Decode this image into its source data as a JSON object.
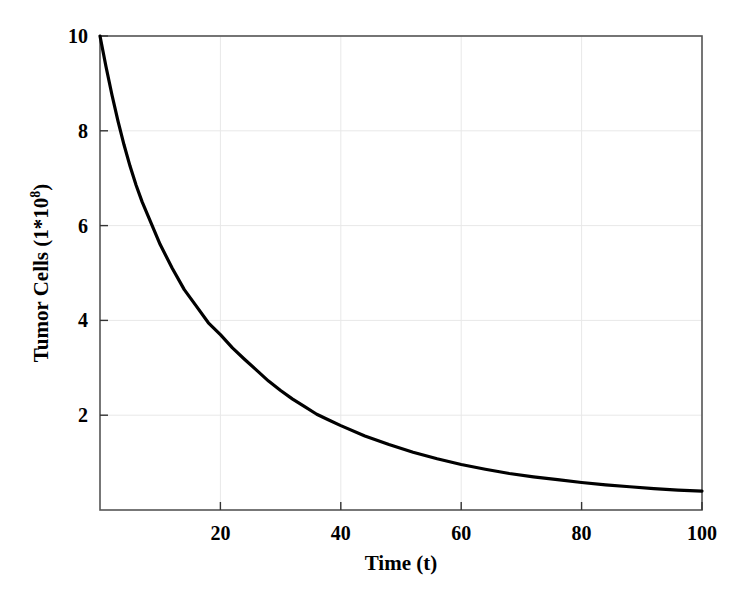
{
  "chart_data": {
    "type": "line",
    "title": "",
    "xlabel": "Time (t)",
    "ylabel_main": "Tumor Cells (1*10",
    "ylabel_exponent": "8",
    "ylabel_close": ")",
    "ylabel_full": "Tumor Cells (1*10^8)",
    "xlim": [
      0,
      100
    ],
    "ylim": [
      0,
      10
    ],
    "xticks": [
      20,
      40,
      60,
      80,
      100
    ],
    "xtick_labels": [
      "20",
      "40",
      "60",
      "80",
      "100"
    ],
    "yticks": [
      2,
      4,
      6,
      8,
      10
    ],
    "ytick_labels": [
      "2",
      "4",
      "6",
      "8",
      "10"
    ],
    "grid": true,
    "grid_color": "#e8e8e8",
    "legend": null,
    "line_color": "#000000",
    "line_width": 3.2,
    "background": "#ffffff",
    "axis_color": "#555555",
    "series": [
      {
        "name": "Tumor Cells",
        "x": [
          0,
          1,
          2,
          3,
          4,
          5,
          6,
          7,
          8,
          9,
          10,
          12,
          14,
          16,
          18,
          20,
          22,
          24,
          26,
          28,
          30,
          32,
          34,
          36,
          38,
          40,
          44,
          48,
          52,
          56,
          60,
          64,
          68,
          72,
          76,
          80,
          84,
          88,
          92,
          96,
          100
        ],
        "values": [
          10.0,
          9.35,
          8.75,
          8.2,
          7.7,
          7.25,
          6.85,
          6.5,
          6.2,
          5.9,
          5.6,
          5.1,
          4.65,
          4.3,
          3.95,
          3.7,
          3.42,
          3.18,
          2.95,
          2.72,
          2.52,
          2.34,
          2.18,
          2.02,
          1.9,
          1.78,
          1.56,
          1.38,
          1.22,
          1.08,
          0.96,
          0.86,
          0.77,
          0.7,
          0.64,
          0.58,
          0.53,
          0.49,
          0.45,
          0.42,
          0.4
        ]
      }
    ],
    "annotations": []
  },
  "labels": {
    "x_axis_title": "Time (t)",
    "y_axis_title": "Tumor Cells (1*10^8)"
  }
}
